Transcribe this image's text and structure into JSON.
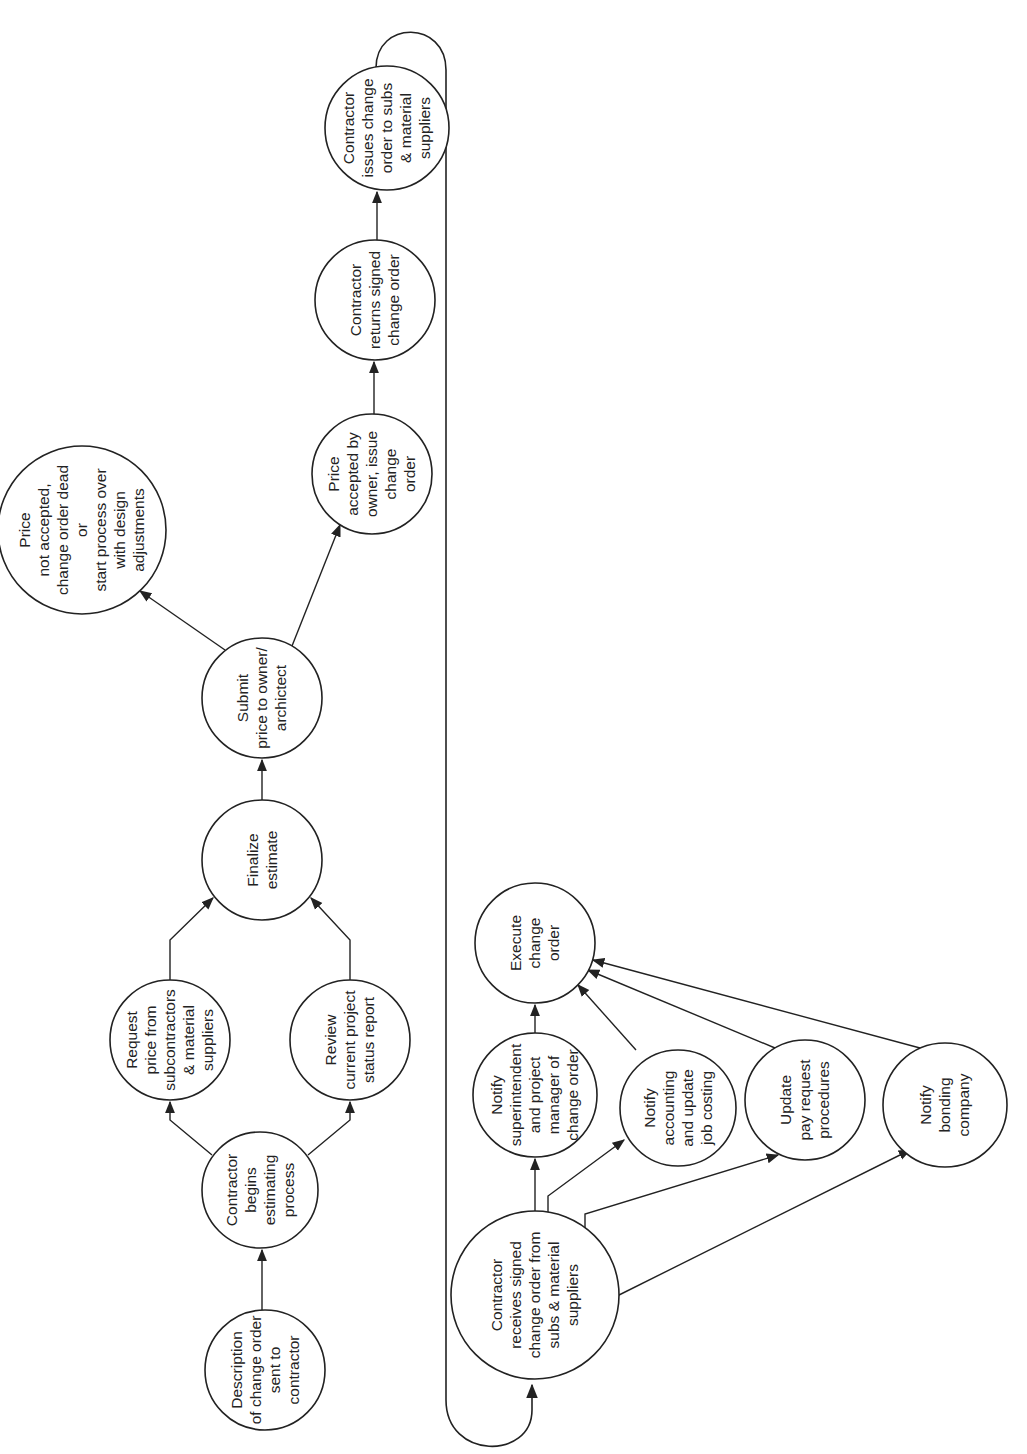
{
  "diagram": {
    "type": "flowchart",
    "orientation": "rotated-90-ccw",
    "nodes": [
      {
        "id": "description",
        "cx": 265,
        "cy": 1370,
        "r": 60,
        "lines": [
          "Description",
          "of change order",
          "sent to",
          "contractor"
        ]
      },
      {
        "id": "begins",
        "cx": 260,
        "cy": 1190,
        "r": 58,
        "lines": [
          "Contractor",
          "begins",
          "estimating",
          "process"
        ]
      },
      {
        "id": "request",
        "cx": 170,
        "cy": 1040,
        "r": 60,
        "lines": [
          "Request",
          "price from",
          "subcontractors",
          "& material",
          "suppliers"
        ]
      },
      {
        "id": "review",
        "cx": 350,
        "cy": 1040,
        "r": 60,
        "lines": [
          "Review",
          "current project",
          "status report"
        ]
      },
      {
        "id": "finalize",
        "cx": 262,
        "cy": 860,
        "r": 60,
        "lines": [
          "Finalize",
          "estimate"
        ]
      },
      {
        "id": "submit",
        "cx": 262,
        "cy": 698,
        "r": 60,
        "lines": [
          "Submit",
          "price to owner/",
          "archictect"
        ]
      },
      {
        "id": "not_accepted",
        "cx": 82,
        "cy": 530,
        "r": 84,
        "lines": [
          "Price",
          "not accepted,",
          "change order dead",
          "or",
          "start process over",
          "with design",
          "adjustments"
        ]
      },
      {
        "id": "accepted",
        "cx": 372,
        "cy": 474,
        "r": 60,
        "lines": [
          "Price",
          "accepted by",
          "owner, issue",
          "change",
          "order"
        ]
      },
      {
        "id": "returns",
        "cx": 375,
        "cy": 300,
        "r": 60,
        "lines": [
          "Contractor",
          "returns signed",
          "change order"
        ]
      },
      {
        "id": "issues",
        "cx": 387,
        "cy": 128,
        "r": 62,
        "lines": [
          "Contractor",
          "issues change",
          "order to subs",
          "& material",
          "suppliers"
        ]
      },
      {
        "id": "execute",
        "cx": 535,
        "cy": 943,
        "r": 60,
        "lines": [
          "Execute",
          "change",
          "order"
        ]
      },
      {
        "id": "notify_super",
        "cx": 535,
        "cy": 1095,
        "r": 62,
        "lines": [
          "Notify",
          "superintendent",
          "and project",
          "manager of",
          "change order"
        ]
      },
      {
        "id": "notify_accounting",
        "cx": 678,
        "cy": 1108,
        "r": 58,
        "lines": [
          "Notify",
          "accounting",
          "and update",
          "job costing"
        ]
      },
      {
        "id": "update_pay",
        "cx": 805,
        "cy": 1100,
        "r": 60,
        "lines": [
          "Update",
          "pay request",
          "procedures"
        ]
      },
      {
        "id": "notify_bonding",
        "cx": 945,
        "cy": 1105,
        "r": 62,
        "lines": [
          "Notify",
          "bonding",
          "company"
        ]
      },
      {
        "id": "receives",
        "cx": 535,
        "cy": 1295,
        "r": 84,
        "lines": [
          "Contractor",
          "receives signed",
          "change order from",
          "subs & material",
          "suppliers"
        ]
      }
    ],
    "edges": [
      {
        "from": "description",
        "to": "begins"
      },
      {
        "from": "begins",
        "to": "request"
      },
      {
        "from": "begins",
        "to": "review"
      },
      {
        "from": "request",
        "to": "finalize"
      },
      {
        "from": "review",
        "to": "finalize"
      },
      {
        "from": "finalize",
        "to": "submit"
      },
      {
        "from": "submit",
        "to": "not_accepted"
      },
      {
        "from": "submit",
        "to": "accepted"
      },
      {
        "from": "accepted",
        "to": "returns"
      },
      {
        "from": "returns",
        "to": "issues"
      },
      {
        "from": "issues",
        "to": "receives",
        "style": "loop-connector"
      },
      {
        "from": "receives",
        "to": "notify_super"
      },
      {
        "from": "receives",
        "to": "notify_accounting"
      },
      {
        "from": "receives",
        "to": "update_pay"
      },
      {
        "from": "receives",
        "to": "notify_bonding"
      },
      {
        "from": "notify_super",
        "to": "execute"
      },
      {
        "from": "notify_accounting",
        "to": "execute"
      },
      {
        "from": "update_pay",
        "to": "execute"
      },
      {
        "from": "notify_bonding",
        "to": "execute"
      }
    ],
    "colors": {
      "stroke": "#222222",
      "background": "#ffffff"
    }
  }
}
